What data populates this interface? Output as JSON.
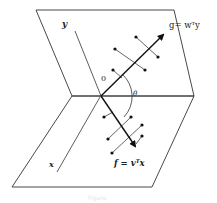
{
  "figure": {
    "labels": {
      "y_axis": "y",
      "x_axis": "x",
      "origin": "0",
      "angle": "θ",
      "g_expr": "g= wᵀy",
      "f_expr": "f = vᵀx"
    },
    "caption": "Figure",
    "colors": {
      "line": "#333333",
      "arrow": "#111111",
      "background": "#ffffff"
    }
  }
}
